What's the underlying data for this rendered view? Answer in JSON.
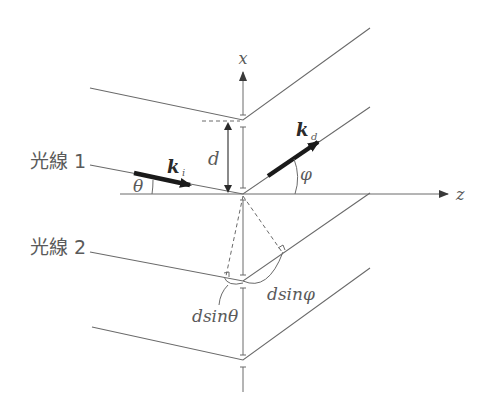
{
  "diagram": {
    "type": "x-ray diffraction from crystal lattice planes (Bragg geometry)",
    "axes": {
      "vertical_label": "x",
      "horizontal_label": "z"
    },
    "rays": [
      {
        "label": "光線 1",
        "incident_vector": "k",
        "incident_sub": "i",
        "diffracted_vector": "k",
        "diffracted_sub": "d"
      },
      {
        "label": "光線 2"
      }
    ],
    "angles": {
      "incident": "θ",
      "diffracted": "φ"
    },
    "spacing_label": "d",
    "path_differences": {
      "incident": "dsinθ",
      "diffracted": "dsinφ"
    },
    "colors": {
      "line": "#6a6a6a",
      "arrow": "#1a1a1a",
      "text": "#5a5a5a",
      "background": "#ffffff"
    }
  }
}
